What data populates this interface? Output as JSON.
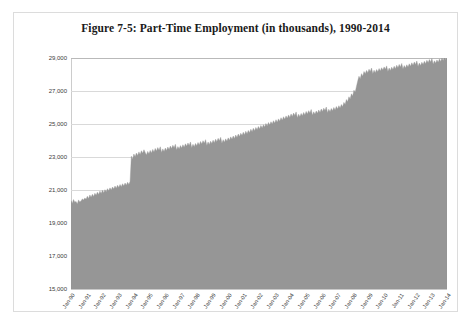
{
  "figure": {
    "title": "Figure 7-5: Part-Time Employment (in thousands), 1990-2014"
  },
  "colors": {
    "series_fill": "#969696",
    "gridline": "#d9d9d9",
    "frame_border": "#dcdcdc",
    "text": "#3a3a3a",
    "title_text": "#1a1a1a"
  },
  "chart_data": {
    "type": "area",
    "title": "Figure 7-5: Part-Time Employment (in thousands), 1990-2014",
    "xlabel": "",
    "ylabel": "",
    "ylim": [
      15000,
      29000
    ],
    "ytick_labels": [
      "29,000",
      "27,000",
      "25,000",
      "23,000",
      "21,000",
      "19,000",
      "17,000",
      "15,000"
    ],
    "ytick_values": [
      29000,
      27000,
      25000,
      23000,
      21000,
      19000,
      17000,
      15000
    ],
    "grid": true,
    "grid_axis": "y",
    "legend": false,
    "legend_position": "none",
    "xtick_labels": [
      "Jan-90",
      "Jan-91",
      "Jan-92",
      "Jan-93",
      "Jan-94",
      "Jan-95",
      "Jan-96",
      "Jan-97",
      "Jan-98",
      "Jan-99",
      "Jan-00",
      "Jan-01",
      "Jan-02",
      "Jan-03",
      "Jan-04",
      "Jan-05",
      "Jan-06",
      "Jan-07",
      "Jan-08",
      "Jan-09",
      "Jan-10",
      "Jan-11",
      "Jan-12",
      "Jan-13",
      "Jan-14"
    ],
    "series": [
      {
        "name": "Part-Time Employment",
        "units": "thousands of persons",
        "frequency": "monthly",
        "start": "Jan-90",
        "end": "Dec-14",
        "values": [
          20350,
          20180,
          20420,
          20260,
          20310,
          20150,
          20400,
          20280,
          20330,
          20460,
          20390,
          20510,
          20440,
          20620,
          20480,
          20700,
          20560,
          20740,
          20610,
          20800,
          20680,
          20870,
          20720,
          20930,
          20790,
          20980,
          20840,
          21020,
          20900,
          21080,
          20950,
          21130,
          21000,
          21180,
          21060,
          21240,
          21100,
          21290,
          21150,
          21330,
          21200,
          21380,
          21240,
          21420,
          21290,
          21470,
          21340,
          21520,
          23050,
          22880,
          23180,
          23010,
          23240,
          23090,
          23310,
          23150,
          23380,
          23220,
          23440,
          23280,
          23120,
          23340,
          23190,
          23400,
          23250,
          23460,
          23300,
          23520,
          23360,
          23570,
          23410,
          23620,
          23280,
          23490,
          23340,
          23540,
          23400,
          23600,
          23450,
          23660,
          23510,
          23710,
          23560,
          23770,
          23420,
          23630,
          23480,
          23690,
          23540,
          23740,
          23590,
          23800,
          23650,
          23850,
          23700,
          23910,
          23560,
          23770,
          23620,
          23820,
          23680,
          23880,
          23730,
          23940,
          23790,
          23990,
          23840,
          24050,
          23700,
          23910,
          23760,
          23960,
          23820,
          24020,
          23870,
          24080,
          23930,
          24130,
          23980,
          24190,
          23840,
          24050,
          23900,
          24100,
          23960,
          24160,
          24010,
          24220,
          24070,
          24270,
          24120,
          24330,
          24180,
          24390,
          24240,
          24440,
          24300,
          24500,
          24350,
          24560,
          24410,
          24610,
          24470,
          24680,
          24530,
          24740,
          24590,
          24790,
          24650,
          24850,
          24700,
          24910,
          24760,
          24960,
          24820,
          25030,
          24880,
          25090,
          24940,
          25140,
          25000,
          25200,
          25050,
          25260,
          25110,
          25310,
          25170,
          25380,
          25230,
          25440,
          25290,
          25490,
          25350,
          25550,
          25400,
          25610,
          25460,
          25660,
          25520,
          25730,
          25380,
          25590,
          25440,
          25640,
          25500,
          25700,
          25550,
          25760,
          25610,
          25810,
          25670,
          25880,
          25530,
          25740,
          25590,
          25790,
          25650,
          25850,
          25700,
          25910,
          25760,
          25960,
          25820,
          26030,
          25680,
          25890,
          25740,
          25940,
          25800,
          26000,
          25850,
          26060,
          25910,
          26110,
          25970,
          26180,
          26040,
          26310,
          26180,
          26480,
          26350,
          26650,
          26520,
          26830,
          26700,
          27050,
          26920,
          27280,
          27600,
          27890,
          27750,
          28050,
          27900,
          28180,
          28040,
          28250,
          28110,
          28320,
          28180,
          28390,
          28050,
          28260,
          28110,
          28300,
          28160,
          28360,
          28210,
          28410,
          28270,
          28460,
          28320,
          28520,
          28180,
          28390,
          28240,
          28440,
          28300,
          28500,
          28350,
          28560,
          28410,
          28610,
          28460,
          28670,
          28330,
          28540,
          28390,
          28590,
          28450,
          28650,
          28500,
          28710,
          28560,
          28760,
          28610,
          28820,
          28480,
          28690,
          28540,
          28740,
          28600,
          28800,
          28650,
          28860,
          28710,
          28910,
          28760,
          28970,
          28620,
          28830,
          28680,
          28880,
          28740,
          28940,
          28790,
          29000,
          28850,
          29050,
          28900,
          29060
        ]
      }
    ]
  }
}
